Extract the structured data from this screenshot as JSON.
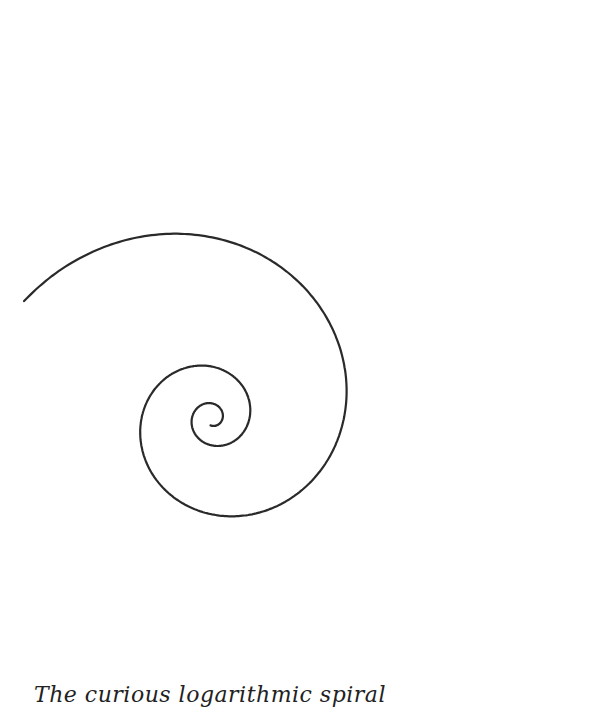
{
  "figure": {
    "type": "logarithmic-spiral",
    "stroke_color": "#2a2a2a",
    "background_color": "#ffffff",
    "turns_visible": 2.6,
    "direction": "clockwise-outward"
  },
  "caption": {
    "text": "The curious logarithmic spiral"
  }
}
